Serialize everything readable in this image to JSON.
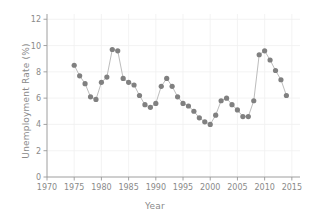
{
  "chart_data": {
    "type": "line",
    "title": "",
    "xlabel": "Year",
    "ylabel": "Unemployment Rate (%)",
    "xlim": [
      1970,
      2016.5
    ],
    "ylim": [
      0,
      12.4
    ],
    "xticks": [
      1970,
      1975,
      1980,
      1985,
      1990,
      1995,
      2000,
      2005,
      2010,
      2015
    ],
    "yticks": [
      0,
      2,
      4,
      6,
      8,
      10,
      12
    ],
    "xtick_labels": [
      "1970",
      "1975",
      "1980",
      "1985",
      "1990",
      "1995",
      "2000",
      "2005",
      "2010",
      "2015"
    ],
    "ytick_labels": [
      "0",
      "2",
      "4",
      "6",
      "8",
      "10",
      "12"
    ],
    "grid": true,
    "legend": null,
    "marker": "circle",
    "marker_color": "#808080",
    "line_color": "#b4b4b4",
    "x": [
      1975,
      1976,
      1977,
      1978,
      1979,
      1980,
      1981,
      1982,
      1983,
      1984,
      1985,
      1986,
      1987,
      1988,
      1989,
      1990,
      1991,
      1992,
      1993,
      1994,
      1995,
      1996,
      1997,
      1998,
      1999,
      2000,
      2001,
      2002,
      2003,
      2004,
      2005,
      2006,
      2007,
      2008,
      2009,
      2010,
      2011,
      2012,
      2013,
      2014
    ],
    "values": [
      8.5,
      7.7,
      7.1,
      6.1,
      5.9,
      7.2,
      7.6,
      9.7,
      9.6,
      7.5,
      7.2,
      7.0,
      6.2,
      5.5,
      5.3,
      5.6,
      6.9,
      7.5,
      6.9,
      6.1,
      5.6,
      5.4,
      5.0,
      4.5,
      4.2,
      4.0,
      4.7,
      5.8,
      6.0,
      5.5,
      5.1,
      4.6,
      4.6,
      5.8,
      9.3,
      9.6,
      8.9,
      8.1,
      7.4,
      6.2
    ],
    "series_name": "Unemployment Rate"
  },
  "axes": {
    "x_title": "Year",
    "y_title": "Unemployment Rate (%)"
  }
}
